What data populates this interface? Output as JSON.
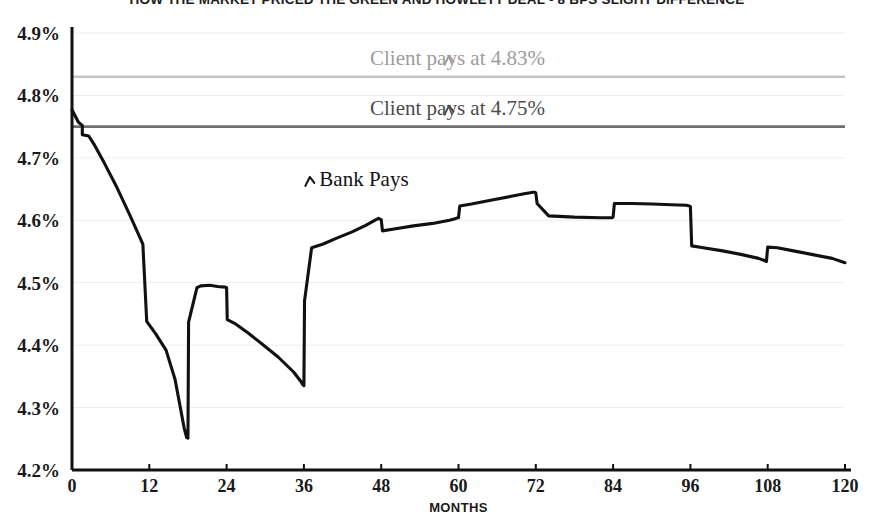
{
  "chart_data": {
    "type": "line",
    "title": "HOW THE MARKET PRICED THE GREEN AND HOWLETT DEAL - 8 BPS SLIGHT DIFFERENCE",
    "xlabel": "MONTHS",
    "ylabel": "",
    "xlim": [
      0,
      120
    ],
    "ylim": [
      4.2,
      4.9
    ],
    "grid": true,
    "legend_position": "inline-annotations",
    "x_ticks": [
      0,
      12,
      24,
      36,
      48,
      60,
      72,
      84,
      96,
      108,
      120
    ],
    "x_tick_labels": [
      "0",
      "12",
      "24",
      "36",
      "48",
      "60",
      "72",
      "84",
      "96",
      "108",
      "120"
    ],
    "y_ticks": [
      4.2,
      4.3,
      4.4,
      4.5,
      4.6,
      4.7,
      4.8,
      4.9
    ],
    "y_tick_labels": [
      "4.2%",
      "4.3%",
      "4.4%",
      "4.5%",
      "4.6%",
      "4.7%",
      "4.8%",
      "4.9%"
    ],
    "series": [
      {
        "name": "Bank Pays",
        "color": "#111111",
        "x": [
          0,
          1,
          1.6,
          1.6,
          2.6,
          3.4,
          5,
          7,
          9,
          11,
          11.6,
          13,
          14.6,
          16,
          17.4,
          17.8,
          18,
          18.1,
          19.4,
          20,
          21.4,
          22.6,
          23.8,
          24,
          24.1,
          25.4,
          27.4,
          29.6,
          32,
          34.4,
          35.6,
          35.8,
          36,
          36.1,
          37.2,
          39,
          41,
          43.4,
          45.6,
          47.2,
          47.6,
          47.8,
          48,
          48.2,
          50,
          53,
          56,
          58.6,
          59.6,
          59.8,
          60,
          60.2,
          62,
          65,
          68,
          70.4,
          71.6,
          71.8,
          72,
          72.2,
          74,
          78,
          82,
          83.6,
          83.8,
          84,
          84.2,
          87,
          90,
          93,
          95.4,
          95.8,
          96,
          96.2,
          98,
          101,
          104,
          106.6,
          107.4,
          107.6,
          107.8,
          108,
          109.5,
          112,
          115,
          118,
          120
        ],
        "y": [
          4.777,
          4.757,
          4.752,
          4.737,
          4.735,
          4.722,
          4.692,
          4.652,
          4.608,
          4.562,
          4.438,
          4.418,
          4.392,
          4.345,
          4.268,
          4.252,
          4.251,
          4.437,
          4.492,
          4.495,
          4.496,
          4.494,
          4.493,
          4.492,
          4.441,
          4.434,
          4.419,
          4.401,
          4.381,
          4.357,
          4.341,
          4.337,
          4.335,
          4.471,
          4.556,
          4.562,
          4.571,
          4.581,
          4.592,
          4.601,
          4.603,
          4.602,
          4.601,
          4.583,
          4.586,
          4.591,
          4.595,
          4.6,
          4.603,
          4.604,
          4.604,
          4.623,
          4.626,
          4.632,
          4.638,
          4.643,
          4.645,
          4.645,
          4.644,
          4.627,
          4.607,
          4.605,
          4.604,
          4.604,
          4.604,
          4.605,
          4.627,
          4.627,
          4.626,
          4.625,
          4.624,
          4.623,
          4.622,
          4.559,
          4.556,
          4.551,
          4.545,
          4.539,
          4.536,
          4.535,
          4.534,
          4.557,
          4.556,
          4.551,
          4.545,
          4.539,
          4.532
        ]
      }
    ],
    "reference_lines": [
      {
        "label": "Client pays at 4.83%",
        "value": 4.83,
        "color": "#c3c3c3",
        "annotation_caret": "caret-up-left",
        "annotation_x": 60,
        "annotation_color": "#9c9c9c"
      },
      {
        "label": "Client pays at 4.75%",
        "value": 4.75,
        "color": "#6f6f6f",
        "annotation_caret": "caret-up-left",
        "annotation_x": 60,
        "annotation_color": "#4c4c4c"
      }
    ],
    "annotations": [
      {
        "label": "Bank Pays",
        "caret": "caret-up-left",
        "color": "#111111",
        "x": 46,
        "y": 4.655
      }
    ]
  }
}
